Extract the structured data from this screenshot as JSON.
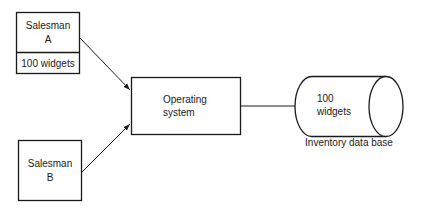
{
  "diagram": {
    "salesman_a": {
      "line1": "Salesman",
      "line2": "A",
      "record": "100 widgets"
    },
    "salesman_b": {
      "line1": "Salesman",
      "line2": "B"
    },
    "operating_system": {
      "line1": "Operating",
      "line2": "system"
    },
    "database": {
      "line1": "100",
      "line2": "widgets",
      "caption": "Inventory data base"
    },
    "stroke_color": "#1a1a1a",
    "background": "#ffffff"
  }
}
